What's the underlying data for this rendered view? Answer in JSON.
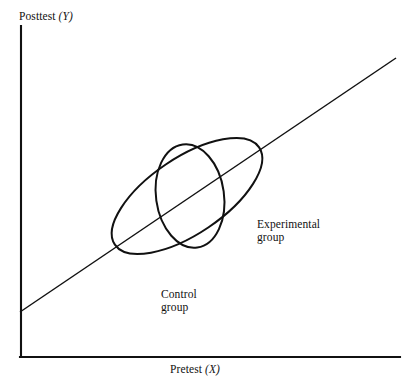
{
  "figure": {
    "background_color": "#ffffff",
    "ink_color": "#111111",
    "width": 412,
    "height": 386,
    "y_axis_label": "Posttest (Y)",
    "x_axis_label": "Pretest (X)"
  },
  "labels": {
    "experimental_group": "Experimental\ngroup",
    "control_group": "Control\ngroup"
  },
  "chart_data": {
    "type": "scatter",
    "title": "",
    "subtitle": "",
    "xlabel": "Pretest (X)",
    "ylabel": "Posttest (Y)",
    "xlim": [
      0,
      100
    ],
    "ylim": [
      0,
      100
    ],
    "grid": false,
    "legend": "none",
    "axis_ticks": [],
    "annotations": [
      {
        "text": "Experimental\ngroup",
        "points_to": "large-tilted-ellipse",
        "x_px": 257,
        "y_px": 218
      },
      {
        "text": "Control\ngroup",
        "points_to": "small-upright-ellipse",
        "x_px": 161,
        "y_px": 288
      }
    ],
    "series": [
      {
        "name": "Experimental group",
        "shape": "ellipse",
        "center_px": [
          187,
          196
        ],
        "radius_x_px": 87,
        "radius_y_px": 38,
        "rotation_deg": -34,
        "stroke": "#111111",
        "fill": "none",
        "note": "Large elongated ellipse aligned with the regression line, indicating a wide spread of pretest and posttest scores with a strong positive correlation."
      },
      {
        "name": "Control group",
        "shape": "ellipse",
        "center_px": [
          190,
          196
        ],
        "radius_x_px": 34,
        "radius_y_px": 52,
        "rotation_deg": -8,
        "stroke": "#111111",
        "fill": "none",
        "note": "Smaller, nearly upright ellipse centered near the middle of the regression line, indicating a narrow pretest range with greater relative posttest variability."
      }
    ],
    "reference_line": {
      "name": "regression line",
      "type": "line",
      "from_px": [
        20,
        312
      ],
      "to_px": [
        396,
        58
      ],
      "slope_sign": "positive",
      "stroke": "#111111"
    },
    "axes": {
      "y_axis_px": {
        "x": 21,
        "y_top": 26,
        "y_bottom": 357
      },
      "x_axis_px": {
        "y": 357,
        "x_left": 21,
        "x_right": 400
      }
    }
  }
}
